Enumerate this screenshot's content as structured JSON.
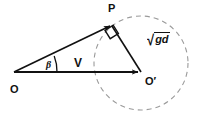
{
  "figure": {
    "kind": "vector-geometry-diagram",
    "background_color": "#ffffff",
    "stroke_color": "#111111",
    "width": 198,
    "height": 121
  },
  "labels": {
    "origin": "O",
    "apex": "P",
    "center": "O′",
    "velocity_vector": "V",
    "angle": "β",
    "radical_sign": "√",
    "radicand": "gd"
  },
  "geometry": {
    "points": {
      "O": {
        "x": 14,
        "y": 72
      },
      "P": {
        "x": 112,
        "y": 25
      },
      "O_prime": {
        "x": 141,
        "y": 72
      }
    },
    "circle": {
      "cx": 141,
      "cy": 63,
      "r": 47,
      "dashed": true,
      "dash_pattern": "5 4"
    },
    "segments": [
      {
        "name": "OP",
        "from": "O",
        "to": "P",
        "arrow": true
      },
      {
        "name": "PO-prime",
        "from": "P",
        "to": "O_prime",
        "arrow": false
      },
      {
        "name": "OO-prime",
        "from": "O",
        "to": "O_prime",
        "arrow": true
      }
    ],
    "right_angle_at": "P",
    "angle_arc_at": "O"
  },
  "label_positions": {
    "O": {
      "x": 10,
      "y": 84
    },
    "P": {
      "x": 108,
      "y": 3
    },
    "O_prime": {
      "x": 145,
      "y": 76
    },
    "V": {
      "x": 74,
      "y": 57
    },
    "beta": {
      "x": 46,
      "y": 60
    },
    "radical": {
      "x": 147,
      "y": 32
    }
  }
}
